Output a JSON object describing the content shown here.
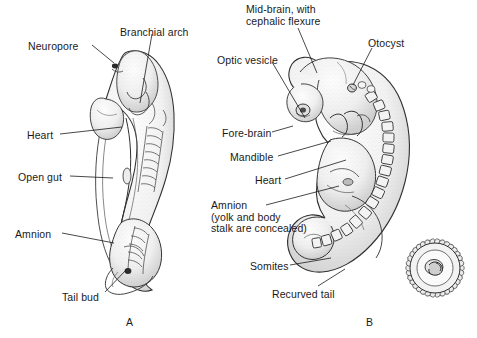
{
  "figure": {
    "background_color": "#ffffff",
    "ink_color": "#1a1a1a"
  },
  "panels": [
    {
      "id": "A",
      "letter": "A",
      "x": 126,
      "y": 316,
      "description": "Dorsal view of elongated embryo with amnion opened"
    },
    {
      "id": "B",
      "letter": "B",
      "x": 366,
      "y": 316,
      "description": "Lateral view of C-shaped embryo with somites and recurved tail"
    }
  ],
  "labels_panel_a": [
    {
      "name": "neuropore",
      "text": "Neuropore",
      "x": 28,
      "y": 41,
      "align": "left",
      "leader": [
        [
          92,
          45
        ],
        [
          114,
          62
        ]
      ]
    },
    {
      "name": "branchial-arch",
      "text": "Branchial arch",
      "x": 120,
      "y": 27,
      "align": "left",
      "leader": [
        [
          152,
          34
        ],
        [
          140,
          103
        ]
      ]
    },
    {
      "name": "heart",
      "text": "Heart",
      "x": 27,
      "y": 130,
      "align": "left",
      "leader": [
        [
          60,
          134
        ],
        [
          122,
          127
        ]
      ]
    },
    {
      "name": "open-gut",
      "text": "Open gut",
      "x": 18,
      "y": 172,
      "align": "left",
      "leader": [
        [
          70,
          176
        ],
        [
          113,
          178
        ]
      ]
    },
    {
      "name": "amnion",
      "text": "Amnion",
      "x": 15,
      "y": 229,
      "align": "left",
      "leader": [
        [
          62,
          233
        ],
        [
          114,
          243
        ]
      ]
    },
    {
      "name": "tail-bud",
      "text": "Tail bud",
      "x": 62,
      "y": 292,
      "align": "left",
      "leader": [
        [
          105,
          292
        ],
        [
          126,
          268
        ]
      ]
    }
  ],
  "labels_panel_b": [
    {
      "name": "mid-brain",
      "text": "Mid-brain, with\ncephalic flexure",
      "x": 246,
      "y": 4,
      "align": "left",
      "leader": [
        [
          298,
          28
        ],
        [
          316,
          72
        ]
      ]
    },
    {
      "name": "otocyst",
      "text": "Otocyst",
      "x": 368,
      "y": 38,
      "align": "left",
      "leader": [
        [
          372,
          48
        ],
        [
          353,
          90
        ]
      ]
    },
    {
      "name": "optic-vesicle",
      "text": "Optic vesicle",
      "x": 217,
      "y": 55,
      "align": "left",
      "leader": [
        [
          272,
          62
        ],
        [
          306,
          120
        ]
      ]
    },
    {
      "name": "fore-brain",
      "text": "Fore-brain",
      "x": 222,
      "y": 128,
      "align": "left",
      "leader": [
        [
          272,
          132
        ],
        [
          294,
          126
        ]
      ]
    },
    {
      "name": "mandible",
      "text": "Mandible",
      "x": 230,
      "y": 152,
      "align": "left",
      "leader": [
        [
          278,
          156
        ],
        [
          330,
          140
        ]
      ]
    },
    {
      "name": "heart",
      "text": "Heart",
      "x": 255,
      "y": 175,
      "align": "left",
      "leader": [
        [
          285,
          179
        ],
        [
          345,
          160
        ]
      ]
    },
    {
      "name": "amnion-yolk",
      "text": "Amnion\n(yolk and body\nstalk are concealed)",
      "x": 211,
      "y": 200,
      "align": "left",
      "leader": [
        [
          266,
          205
        ],
        [
          338,
          186
        ]
      ]
    },
    {
      "name": "somites",
      "text": "Somites",
      "x": 250,
      "y": 261,
      "align": "left",
      "leader": [
        [
          290,
          265
        ],
        [
          330,
          258
        ]
      ]
    },
    {
      "name": "recurved-tail",
      "text": "Recurved tail",
      "x": 272,
      "y": 289,
      "align": "left",
      "leader": [
        [
          318,
          286
        ],
        [
          344,
          270
        ]
      ]
    }
  ],
  "inset": {
    "name": "chorionic-vesicle",
    "center_x": 435,
    "center_y": 268,
    "radius": 33,
    "villi_count": 34,
    "description": "Chorionic vesicle with villi, embryo shown in situ"
  }
}
